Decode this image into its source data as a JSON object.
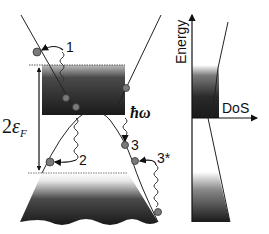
{
  "diagram": {
    "type": "band-structure-with-density-of-states",
    "left_panel": {
      "gap_label": "2ε",
      "gap_label_sub": "F",
      "photon_label": "ħω",
      "process_labels": [
        "1",
        "2",
        "3",
        "3*"
      ]
    },
    "right_panel": {
      "y_axis_label": "Energy",
      "x_axis_label": "DoS"
    },
    "colors": {
      "band_dark": "#1a1a1a",
      "band_light": "#ffffff",
      "electron_dot": "#7a7a7a",
      "line": "#222222"
    }
  }
}
